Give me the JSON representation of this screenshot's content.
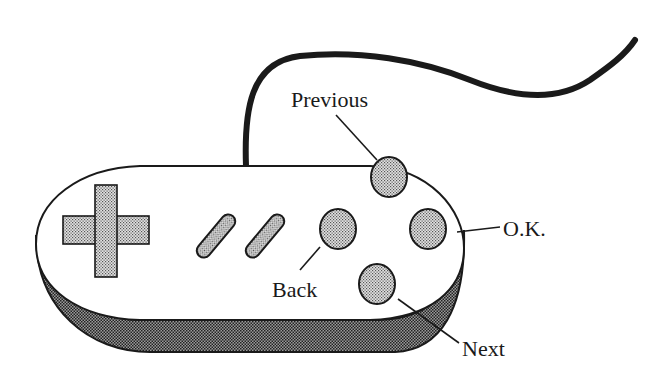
{
  "diagram": {
    "type": "game-controller-illustration",
    "colors": {
      "ink": "#1a1a1a",
      "fill": "#ffffff",
      "stipple_light": "#c8c8c8",
      "stipple_dark": "#8a8a8a"
    },
    "labels": {
      "previous": "Previous",
      "ok": "O.K.",
      "back": "Back",
      "next": "Next"
    },
    "parts": [
      {
        "id": "cable",
        "description": "Cable from top of controller"
      },
      {
        "id": "dpad",
        "description": "Directional pad (cross)"
      },
      {
        "id": "select",
        "description": "Diagonal pill button 1"
      },
      {
        "id": "start",
        "description": "Diagonal pill button 2"
      },
      {
        "id": "back-button",
        "label": "Back"
      },
      {
        "id": "previous-button",
        "label": "Previous"
      },
      {
        "id": "ok-button",
        "label": "O.K."
      },
      {
        "id": "next-button",
        "label": "Next"
      }
    ]
  }
}
